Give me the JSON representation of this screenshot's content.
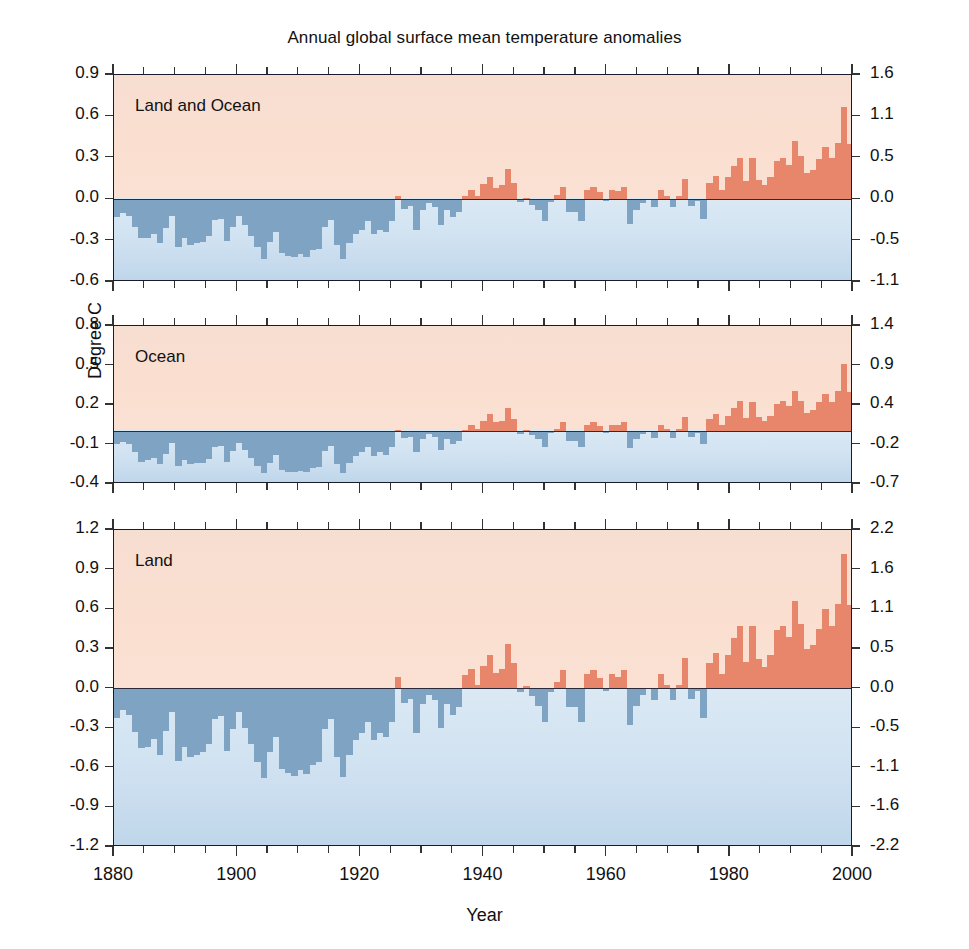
{
  "chart_data": {
    "type": "bar",
    "title": "Annual global surface mean temperature anomalies",
    "xlabel": "Year",
    "ylabel": "Degree C",
    "x_range": [
      1880,
      2000
    ],
    "x_ticks": [
      1880,
      1900,
      1920,
      1940,
      1960,
      1980,
      2000
    ],
    "x_minor_tick_step": 5,
    "grid": false,
    "legend": "none",
    "colors": {
      "positive_bar": "#e8866c",
      "negative_bar": "#7fa3c3",
      "warm_background": "#fadfd0",
      "cool_background": "#cfe1f1",
      "axis": "#1a1a2a"
    },
    "panels": [
      {
        "label": "Land and Ocean",
        "ylim": [
          -0.6,
          0.9
        ],
        "yticks_left": [
          0.9,
          0.6,
          0.3,
          0.0,
          -0.3,
          -0.6
        ],
        "ytick_labels_left": [
          "0.9",
          "0.6",
          "0.3",
          "0.0",
          "-0.3",
          "-0.6"
        ],
        "yticks_right_unit": "Degree F",
        "ytick_labels_right": [
          "1.6",
          "1.1",
          "0.5",
          "0.0",
          "-0.5",
          "-1.1"
        ],
        "yticks_right_values": [
          1.6,
          1.1,
          0.5,
          0.0,
          -0.5,
          -1.1
        ],
        "x": [
          1880,
          1881,
          1882,
          1883,
          1884,
          1885,
          1886,
          1887,
          1888,
          1889,
          1890,
          1891,
          1892,
          1893,
          1894,
          1895,
          1896,
          1897,
          1898,
          1899,
          1900,
          1901,
          1902,
          1903,
          1904,
          1905,
          1906,
          1907,
          1908,
          1909,
          1910,
          1911,
          1912,
          1913,
          1914,
          1915,
          1916,
          1917,
          1918,
          1919,
          1920,
          1921,
          1922,
          1923,
          1924,
          1925,
          1926,
          1927,
          1928,
          1929,
          1930,
          1931,
          1932,
          1933,
          1934,
          1935,
          1936,
          1937,
          1938,
          1939,
          1940,
          1941,
          1942,
          1943,
          1944,
          1945,
          1946,
          1947,
          1948,
          1949,
          1950,
          1951,
          1952,
          1953,
          1954,
          1955,
          1956,
          1957,
          1958,
          1959,
          1960,
          1961,
          1962,
          1963,
          1964,
          1965,
          1966,
          1967,
          1968,
          1969,
          1970,
          1971,
          1972,
          1973,
          1974,
          1975,
          1976,
          1977,
          1978,
          1979,
          1980,
          1981,
          1982,
          1983,
          1984,
          1985,
          1986,
          1987,
          1988,
          1989,
          1990,
          1991,
          1992,
          1993,
          1994,
          1995,
          1996,
          1997,
          1998,
          1999,
          2000
        ],
        "values": [
          -0.13,
          -0.1,
          -0.12,
          -0.2,
          -0.28,
          -0.28,
          -0.25,
          -0.32,
          -0.21,
          -0.12,
          -0.35,
          -0.28,
          -0.33,
          -0.32,
          -0.31,
          -0.27,
          -0.15,
          -0.14,
          -0.3,
          -0.2,
          -0.12,
          -0.19,
          -0.27,
          -0.35,
          -0.43,
          -0.31,
          -0.24,
          -0.39,
          -0.41,
          -0.42,
          -0.4,
          -0.42,
          -0.37,
          -0.36,
          -0.2,
          -0.15,
          -0.33,
          -0.43,
          -0.32,
          -0.25,
          -0.22,
          -0.16,
          -0.25,
          -0.22,
          -0.24,
          -0.16,
          0.02,
          -0.07,
          -0.05,
          -0.22,
          -0.08,
          -0.03,
          -0.06,
          -0.19,
          -0.08,
          -0.13,
          -0.09,
          0.02,
          0.07,
          0.02,
          0.11,
          0.16,
          0.08,
          0.1,
          0.22,
          0.12,
          -0.02,
          0.01,
          -0.04,
          -0.08,
          -0.16,
          -0.02,
          0.03,
          0.09,
          -0.09,
          -0.09,
          -0.16,
          0.07,
          0.09,
          0.05,
          -0.01,
          0.07,
          0.06,
          0.09,
          -0.18,
          -0.08,
          -0.03,
          0.0,
          -0.06,
          0.07,
          0.02,
          -0.06,
          0.02,
          0.15,
          -0.05,
          -0.01,
          -0.14,
          0.12,
          0.17,
          0.07,
          0.16,
          0.24,
          0.3,
          0.13,
          0.3,
          0.14,
          0.1,
          0.16,
          0.28,
          0.3,
          0.25,
          0.42,
          0.31,
          0.19,
          0.21,
          0.29,
          0.38,
          0.3,
          0.41,
          0.67,
          0.4,
          0.41
        ]
      },
      {
        "label": "Ocean",
        "ylim": [
          -0.4,
          0.8
        ],
        "yticks_left": [
          0.8,
          0.5,
          0.2,
          -0.1,
          -0.4
        ],
        "ytick_labels_left": [
          "0.8",
          "0.5",
          "0.2",
          "-0.1",
          "-0.4"
        ],
        "yticks_right_unit": "Degree F",
        "ytick_labels_right": [
          "1.4",
          "0.9",
          "0.4",
          "-0.2",
          "-0.7"
        ],
        "yticks_right_values": [
          1.4,
          0.9,
          0.4,
          -0.2,
          -0.7
        ],
        "x": [
          1880,
          1881,
          1882,
          1883,
          1884,
          1885,
          1886,
          1887,
          1888,
          1889,
          1890,
          1891,
          1892,
          1893,
          1894,
          1895,
          1896,
          1897,
          1898,
          1899,
          1900,
          1901,
          1902,
          1903,
          1904,
          1905,
          1906,
          1907,
          1908,
          1909,
          1910,
          1911,
          1912,
          1913,
          1914,
          1915,
          1916,
          1917,
          1918,
          1919,
          1920,
          1921,
          1922,
          1923,
          1924,
          1925,
          1926,
          1927,
          1928,
          1929,
          1930,
          1931,
          1932,
          1933,
          1934,
          1935,
          1936,
          1937,
          1938,
          1939,
          1940,
          1941,
          1942,
          1943,
          1944,
          1945,
          1946,
          1947,
          1948,
          1949,
          1950,
          1951,
          1952,
          1953,
          1954,
          1955,
          1956,
          1957,
          1958,
          1959,
          1960,
          1961,
          1962,
          1963,
          1964,
          1965,
          1966,
          1967,
          1968,
          1969,
          1970,
          1971,
          1972,
          1973,
          1974,
          1975,
          1976,
          1977,
          1978,
          1979,
          1980,
          1981,
          1982,
          1983,
          1984,
          1985,
          1986,
          1987,
          1988,
          1989,
          1990,
          1991,
          1992,
          1993,
          1994,
          1995,
          1996,
          1997,
          1998,
          1999,
          2000
        ],
        "values": [
          -0.1,
          -0.08,
          -0.1,
          -0.16,
          -0.23,
          -0.22,
          -0.2,
          -0.25,
          -0.17,
          -0.09,
          -0.26,
          -0.22,
          -0.25,
          -0.24,
          -0.24,
          -0.21,
          -0.12,
          -0.11,
          -0.23,
          -0.15,
          -0.09,
          -0.14,
          -0.2,
          -0.26,
          -0.32,
          -0.24,
          -0.18,
          -0.29,
          -0.31,
          -0.31,
          -0.3,
          -0.31,
          -0.28,
          -0.27,
          -0.15,
          -0.11,
          -0.25,
          -0.32,
          -0.24,
          -0.19,
          -0.16,
          -0.12,
          -0.19,
          -0.16,
          -0.18,
          -0.12,
          0.01,
          -0.05,
          -0.04,
          -0.16,
          -0.06,
          -0.02,
          -0.04,
          -0.14,
          -0.06,
          -0.1,
          -0.07,
          0.01,
          0.05,
          0.02,
          0.08,
          0.13,
          0.07,
          0.08,
          0.18,
          0.09,
          -0.02,
          0.01,
          -0.03,
          -0.06,
          -0.12,
          -0.01,
          0.02,
          0.07,
          -0.07,
          -0.07,
          -0.12,
          0.05,
          0.07,
          0.04,
          -0.01,
          0.05,
          0.05,
          0.07,
          -0.13,
          -0.06,
          -0.02,
          0.0,
          -0.05,
          0.05,
          0.02,
          -0.05,
          0.02,
          0.11,
          -0.04,
          -0.01,
          -0.1,
          0.09,
          0.13,
          0.05,
          0.12,
          0.18,
          0.23,
          0.1,
          0.22,
          0.11,
          0.08,
          0.12,
          0.21,
          0.23,
          0.19,
          0.31,
          0.23,
          0.14,
          0.16,
          0.22,
          0.28,
          0.22,
          0.31,
          0.51,
          0.3,
          0.3
        ]
      },
      {
        "label": "Land",
        "ylim": [
          -1.2,
          1.2
        ],
        "yticks_left": [
          1.2,
          0.9,
          0.6,
          0.3,
          0.0,
          -0.3,
          -0.6,
          -0.9,
          -1.2
        ],
        "ytick_labels_left": [
          "1.2",
          "0.9",
          "0.6",
          "0.3",
          "0.0",
          "-0.3",
          "-0.6",
          "-0.9",
          "-1.2"
        ],
        "yticks_right_unit": "Degree F",
        "ytick_labels_right": [
          "2.2",
          "1.6",
          "1.1",
          "0.5",
          "0.0",
          "-0.5",
          "-1.1",
          "-1.6",
          "-2.2"
        ],
        "yticks_right_values": [
          2.2,
          1.6,
          1.1,
          0.5,
          0.0,
          -0.5,
          -1.1,
          -1.6,
          -2.2
        ],
        "x": [
          1880,
          1881,
          1882,
          1883,
          1884,
          1885,
          1886,
          1887,
          1888,
          1889,
          1890,
          1891,
          1892,
          1893,
          1894,
          1895,
          1896,
          1897,
          1898,
          1899,
          1900,
          1901,
          1902,
          1903,
          1904,
          1905,
          1906,
          1907,
          1908,
          1909,
          1910,
          1911,
          1912,
          1913,
          1914,
          1915,
          1916,
          1917,
          1918,
          1919,
          1920,
          1921,
          1922,
          1923,
          1924,
          1925,
          1926,
          1927,
          1928,
          1929,
          1930,
          1931,
          1932,
          1933,
          1934,
          1935,
          1936,
          1937,
          1938,
          1939,
          1940,
          1941,
          1942,
          1943,
          1944,
          1945,
          1946,
          1947,
          1948,
          1949,
          1950,
          1951,
          1952,
          1953,
          1954,
          1955,
          1956,
          1957,
          1958,
          1959,
          1960,
          1961,
          1962,
          1963,
          1964,
          1965,
          1966,
          1967,
          1968,
          1969,
          1970,
          1971,
          1972,
          1973,
          1974,
          1975,
          1976,
          1977,
          1978,
          1979,
          1980,
          1981,
          1982,
          1983,
          1984,
          1985,
          1986,
          1987,
          1988,
          1989,
          1990,
          1991,
          1992,
          1993,
          1994,
          1995,
          1996,
          1997,
          1998,
          1999,
          2000
        ],
        "values": [
          -0.22,
          -0.16,
          -0.2,
          -0.33,
          -0.45,
          -0.44,
          -0.38,
          -0.5,
          -0.32,
          -0.18,
          -0.55,
          -0.44,
          -0.52,
          -0.5,
          -0.48,
          -0.42,
          -0.23,
          -0.21,
          -0.47,
          -0.31,
          -0.18,
          -0.3,
          -0.42,
          -0.56,
          -0.68,
          -0.48,
          -0.37,
          -0.61,
          -0.64,
          -0.66,
          -0.62,
          -0.65,
          -0.58,
          -0.56,
          -0.31,
          -0.23,
          -0.52,
          -0.67,
          -0.5,
          -0.39,
          -0.34,
          -0.25,
          -0.39,
          -0.34,
          -0.37,
          -0.25,
          0.09,
          -0.11,
          -0.08,
          -0.34,
          -0.12,
          -0.05,
          -0.09,
          -0.3,
          -0.12,
          -0.2,
          -0.14,
          0.1,
          0.15,
          0.03,
          0.17,
          0.25,
          0.12,
          0.15,
          0.34,
          0.19,
          -0.03,
          0.02,
          -0.06,
          -0.13,
          -0.25,
          -0.03,
          0.05,
          0.14,
          -0.14,
          -0.14,
          -0.25,
          0.11,
          0.14,
          0.08,
          -0.02,
          0.11,
          0.09,
          0.14,
          -0.28,
          -0.13,
          -0.05,
          0.0,
          -0.09,
          0.11,
          0.03,
          -0.09,
          0.03,
          0.23,
          -0.08,
          -0.02,
          -0.22,
          0.19,
          0.27,
          0.11,
          0.25,
          0.38,
          0.47,
          0.2,
          0.47,
          0.22,
          0.16,
          0.25,
          0.44,
          0.47,
          0.39,
          0.66,
          0.49,
          0.3,
          0.33,
          0.45,
          0.6,
          0.47,
          0.64,
          1.02,
          0.63,
          0.78
        ]
      }
    ]
  },
  "labels": {
    "title": "Annual global surface mean temperature anomalies",
    "y_axis": "Degree C",
    "x_axis": "Year"
  }
}
